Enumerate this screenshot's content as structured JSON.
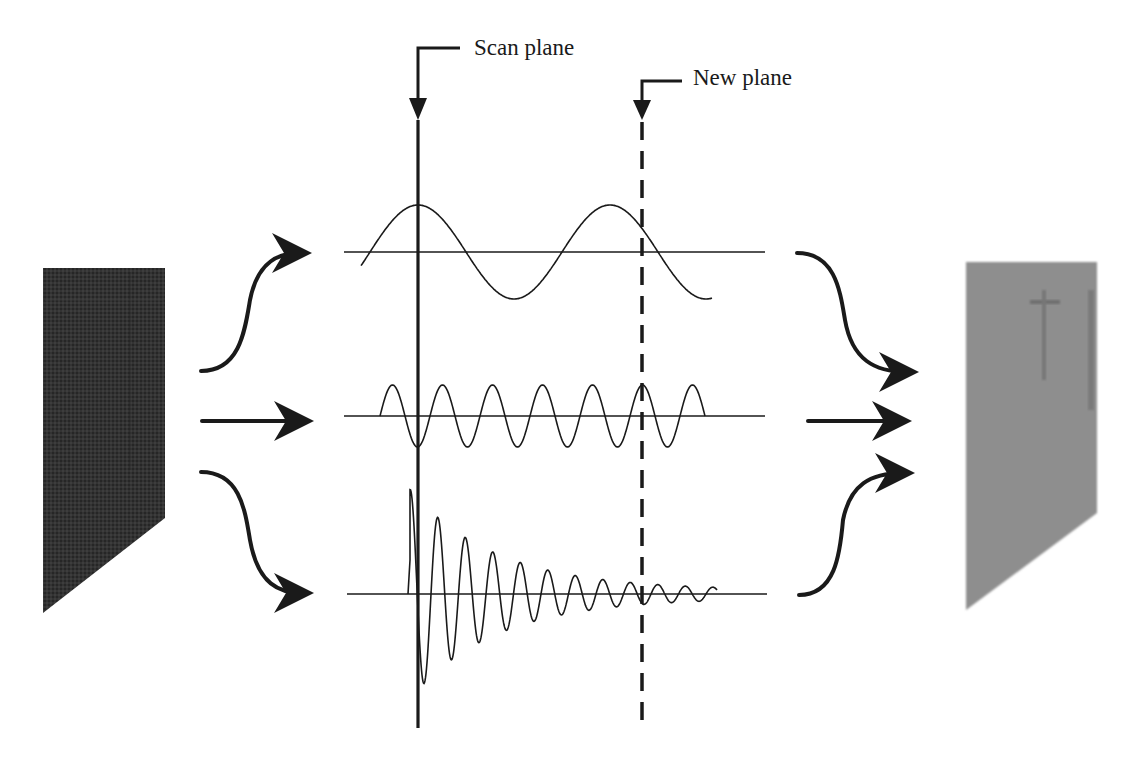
{
  "labels": {
    "scan_plane": "Scan plane",
    "new_plane": "New plane"
  },
  "colors": {
    "ink": "#1a1a1a",
    "input_shape": "#2e2e2e",
    "output_shape": "#8c8c8c",
    "background": "#ffffff"
  },
  "diagram": {
    "input_image": "dark tapered specimen (input)",
    "output_image": "light gray tapered specimen (output)",
    "components": [
      {
        "name": "low-frequency sine",
        "cycles_shown": 1.8
      },
      {
        "name": "high-frequency sine",
        "cycles_shown": 6.5
      },
      {
        "name": "damped oscillation",
        "cycles_shown": 11
      }
    ]
  }
}
